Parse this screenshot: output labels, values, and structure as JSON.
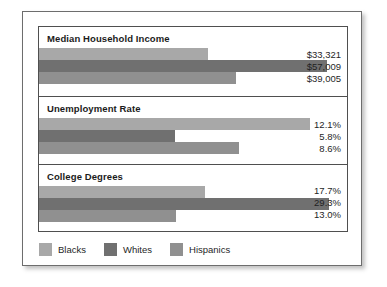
{
  "chart_data": {
    "type": "bar",
    "title": "",
    "orientation": "horizontal",
    "grid": false,
    "legend_position": "bottom",
    "categories": [
      "Median Household Income",
      "Unemployment Rate",
      "College Degrees"
    ],
    "series": [
      {
        "name": "Blacks",
        "color": "#a8a8a8",
        "values": [
          33321,
          12.1,
          17.7
        ],
        "labels": [
          "$33,321",
          "12.1%",
          "17.7%"
        ]
      },
      {
        "name": "Whites",
        "color": "#707070",
        "values": [
          57009,
          5.8,
          29.3
        ],
        "labels": [
          "$57,009",
          "5.8%",
          "29.3%"
        ]
      },
      {
        "name": "Hispanics",
        "color": "#909090",
        "values": [
          39005,
          8.6,
          13.0
        ],
        "labels": [
          "$39,005",
          "8.6%",
          "13.0%"
        ]
      }
    ],
    "panels": [
      {
        "title": "Median Household Income",
        "unit": "dollars",
        "rows": [
          {
            "series": "Blacks",
            "label": "$33,321",
            "value": 33321,
            "bar_pct": 55.0
          },
          {
            "series": "Whites",
            "label": "$57,009",
            "value": 57009,
            "bar_pct": 93.5
          },
          {
            "series": "Hispanics",
            "label": "$39,005",
            "value": 39005,
            "bar_pct": 64.0
          }
        ]
      },
      {
        "title": "Unemployment Rate",
        "unit": "percent",
        "rows": [
          {
            "series": "Blacks",
            "label": "12.1%",
            "value": 12.1,
            "bar_pct": 88.0
          },
          {
            "series": "Whites",
            "label": "5.8%",
            "value": 5.8,
            "bar_pct": 44.0
          },
          {
            "series": "Hispanics",
            "label": "8.6%",
            "value": 8.6,
            "bar_pct": 65.0
          }
        ]
      },
      {
        "title": "College Degrees",
        "unit": "percent",
        "rows": [
          {
            "series": "Blacks",
            "label": "17.7%",
            "value": 17.7,
            "bar_pct": 54.0
          },
          {
            "series": "Whites",
            "label": "29.3%",
            "value": 29.3,
            "bar_pct": 94.0
          },
          {
            "series": "Hispanics",
            "label": "13.0%",
            "value": 13.0,
            "bar_pct": 44.5
          }
        ]
      }
    ],
    "legend": [
      {
        "label": "Blacks",
        "color": "#a8a8a8"
      },
      {
        "label": "Whites",
        "color": "#707070"
      },
      {
        "label": "Hispanics",
        "color": "#909090"
      }
    ]
  }
}
